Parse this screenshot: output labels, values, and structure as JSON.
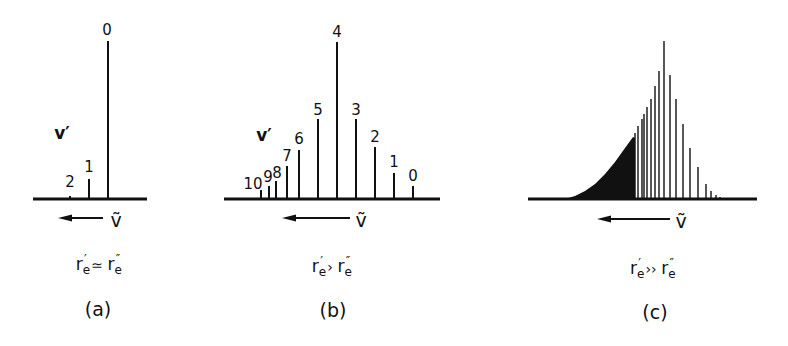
{
  "figure": {
    "panels": [
      {
        "id": "a",
        "caption": "(a)",
        "relation": "rₑ′ ≃ rₑ″",
        "relation_parts": {
          "left": "r",
          "lsub": "e",
          "lsup": "′",
          "op": "≃",
          "right": "r",
          "rsub": "e",
          "rsup": "″"
        },
        "axis_label": "ṽ",
        "series_label": "v′",
        "baseline": {
          "x1": 33,
          "x2": 147,
          "y": 199
        },
        "arrow": {
          "x_tip": 58,
          "x_tail": 103,
          "y": 218
        },
        "nu_pos": {
          "x": 116,
          "y": 220
        },
        "vprime_pos": {
          "x": 62,
          "y": 133
        },
        "relation_pos": {
          "x": 98,
          "y": 264
        },
        "caption_pos": {
          "x": 98,
          "y": 309
        },
        "lines": [
          {
            "v": "0",
            "x": 108,
            "top": 41,
            "label_x": 107,
            "label_y": 30
          },
          {
            "v": "1",
            "x": 89,
            "top": 179,
            "label_x": 89,
            "label_y": 167
          },
          {
            "v": "2",
            "x": 70,
            "top": 196,
            "label_x": 70,
            "label_y": 182
          }
        ]
      },
      {
        "id": "b",
        "caption": "(b)",
        "relation": "rₑ′ > rₑ″",
        "relation_parts": {
          "left": "r",
          "lsub": "e",
          "lsup": "′",
          "op": "›",
          "right": "r",
          "rsub": "e",
          "rsup": "″"
        },
        "axis_label": "ṽ",
        "series_label": "v′",
        "baseline": {
          "x1": 224,
          "x2": 440,
          "y": 199
        },
        "arrow": {
          "x_tip": 282,
          "x_tail": 350,
          "y": 218
        },
        "nu_pos": {
          "x": 361,
          "y": 220
        },
        "vprime_pos": {
          "x": 264,
          "y": 135
        },
        "relation_pos": {
          "x": 331,
          "y": 266
        },
        "caption_pos": {
          "x": 333,
          "y": 310
        },
        "lines": [
          {
            "v": "10",
            "x": 261,
            "top": 190,
            "label_x": 253,
            "label_y": 184
          },
          {
            "v": "9",
            "x": 269,
            "top": 186,
            "label_x": 268,
            "label_y": 177
          },
          {
            "v": "8",
            "x": 276,
            "top": 181,
            "label_x": 277,
            "label_y": 173
          },
          {
            "v": "7",
            "x": 287,
            "top": 166,
            "label_x": 287,
            "label_y": 156
          },
          {
            "v": "6",
            "x": 299,
            "top": 150,
            "label_x": 299,
            "label_y": 139
          },
          {
            "v": "5",
            "x": 318,
            "top": 119,
            "label_x": 318,
            "label_y": 110
          },
          {
            "v": "4",
            "x": 337,
            "top": 42,
            "label_x": 337,
            "label_y": 32
          },
          {
            "v": "3",
            "x": 356,
            "top": 119,
            "label_x": 356,
            "label_y": 110
          },
          {
            "v": "2",
            "x": 375,
            "top": 147,
            "label_x": 375,
            "label_y": 137
          },
          {
            "v": "1",
            "x": 394,
            "top": 173,
            "label_x": 394,
            "label_y": 162
          },
          {
            "v": "0",
            "x": 413,
            "top": 186,
            "label_x": 413,
            "label_y": 176
          }
        ]
      },
      {
        "id": "c",
        "caption": "(c)",
        "relation": "rₑ′ ≫ rₑ″",
        "relation_parts": {
          "left": "r",
          "lsub": "e",
          "lsup": "′",
          "op": "››",
          "right": "r",
          "rsub": "e",
          "rsup": "″"
        },
        "axis_label": "ṽ",
        "baseline": {
          "x1": 528,
          "x2": 757,
          "y": 199
        },
        "arrow": {
          "x_tip": 597,
          "x_tail": 670,
          "y": 219
        },
        "nu_pos": {
          "x": 681,
          "y": 221
        },
        "relation_pos": {
          "x": 652,
          "y": 268
        },
        "caption_pos": {
          "x": 655,
          "y": 312
        },
        "continuum": {
          "points": [
            [
              565,
              199
            ],
            [
              575,
              196
            ],
            [
              585,
              191
            ],
            [
              595,
              184
            ],
            [
              605,
              174
            ],
            [
              615,
              162
            ],
            [
              625,
              148
            ],
            [
              633,
              137
            ],
            [
              635,
              138
            ],
            [
              635,
              199
            ]
          ]
        },
        "lines": [
          {
            "x": 635,
            "top": 133
          },
          {
            "x": 638,
            "top": 126
          },
          {
            "x": 642,
            "top": 119
          },
          {
            "x": 644,
            "top": 114
          },
          {
            "x": 647,
            "top": 107
          },
          {
            "x": 651,
            "top": 99
          },
          {
            "x": 655,
            "top": 86
          },
          {
            "x": 659,
            "top": 71
          },
          {
            "x": 664,
            "top": 41
          },
          {
            "x": 670,
            "top": 75
          },
          {
            "x": 676,
            "top": 99
          },
          {
            "x": 683,
            "top": 124
          },
          {
            "x": 690,
            "top": 148
          },
          {
            "x": 698,
            "top": 167
          },
          {
            "x": 706,
            "top": 184
          },
          {
            "x": 711,
            "top": 191
          },
          {
            "x": 716,
            "top": 195
          },
          {
            "x": 720,
            "top": 197
          }
        ]
      }
    ],
    "colors": {
      "ink": "#111111",
      "background": "#ffffff"
    }
  }
}
